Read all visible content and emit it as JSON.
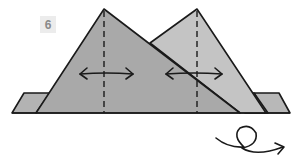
{
  "step": {
    "number": "6"
  },
  "diagram": {
    "colors": {
      "dark_fill": "#a9a9a9",
      "light_fill": "#c4c4c4",
      "flap_fill": "#b3b3b3",
      "stroke": "#1a1a1a",
      "badge_bg": "#ececec",
      "badge_text": "#8a8a8a"
    },
    "elements": [
      "left-peak",
      "right-peak",
      "left-valley-fold-dashed-line",
      "right-valley-fold-dashed-line",
      "left-double-headed-arrow",
      "right-double-headed-arrow",
      "left-base-flap",
      "right-base-flaps",
      "turn-over-arrow"
    ]
  }
}
